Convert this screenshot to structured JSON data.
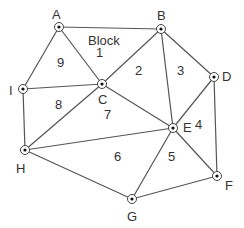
{
  "diagram": {
    "title_label": "Block",
    "nodes": [
      {
        "id": "A",
        "x": 59,
        "y": 27,
        "lx": 52,
        "ly": 8
      },
      {
        "id": "B",
        "x": 161,
        "y": 29,
        "lx": 157,
        "ly": 9
      },
      {
        "id": "C",
        "x": 102,
        "y": 84,
        "lx": 98,
        "ly": 93
      },
      {
        "id": "D",
        "x": 214,
        "y": 77,
        "lx": 222,
        "ly": 70
      },
      {
        "id": "E",
        "x": 173,
        "y": 128,
        "lx": 183,
        "ly": 121
      },
      {
        "id": "F",
        "x": 217,
        "y": 176,
        "lx": 225,
        "ly": 179
      },
      {
        "id": "G",
        "x": 132,
        "y": 199,
        "lx": 127,
        "ly": 210
      },
      {
        "id": "H",
        "x": 25,
        "y": 150,
        "lx": 16,
        "ly": 162
      },
      {
        "id": "I",
        "x": 23,
        "y": 89,
        "lx": 9,
        "ly": 84
      }
    ],
    "edges": [
      [
        "A",
        "B"
      ],
      [
        "A",
        "I"
      ],
      [
        "A",
        "C"
      ],
      [
        "B",
        "C"
      ],
      [
        "B",
        "E"
      ],
      [
        "B",
        "D"
      ],
      [
        "C",
        "I"
      ],
      [
        "C",
        "H"
      ],
      [
        "C",
        "E"
      ],
      [
        "D",
        "E"
      ],
      [
        "D",
        "F"
      ],
      [
        "E",
        "F"
      ],
      [
        "E",
        "H"
      ],
      [
        "E",
        "G"
      ],
      [
        "F",
        "G"
      ],
      [
        "H",
        "G"
      ],
      [
        "I",
        "H"
      ]
    ],
    "regions": [
      {
        "label": "1",
        "x": 100,
        "y": 52
      },
      {
        "label": "2",
        "x": 139,
        "y": 70
      },
      {
        "label": "3",
        "x": 181,
        "y": 70
      },
      {
        "label": "4",
        "x": 199,
        "y": 124
      },
      {
        "label": "5",
        "x": 172,
        "y": 156
      },
      {
        "label": "6",
        "x": 118,
        "y": 156
      },
      {
        "label": "7",
        "x": 108,
        "y": 114
      },
      {
        "label": "8",
        "x": 59,
        "y": 104
      },
      {
        "label": "9",
        "x": 61,
        "y": 62
      }
    ],
    "block_label_pos": {
      "x": 88,
      "y": 34
    },
    "colors": {
      "edge": "#555555",
      "text": "#333333",
      "background": "#ffffff"
    }
  }
}
